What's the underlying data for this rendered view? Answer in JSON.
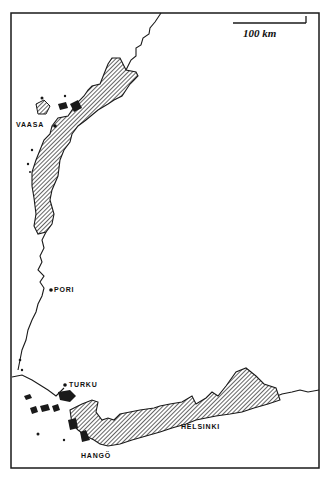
{
  "map": {
    "scale_label": "100 km",
    "colors": {
      "ink": "#1a1a1a",
      "background": "#ffffff",
      "hatch": "#2a2a2a"
    },
    "legend_pattern": "diagonal-hatch",
    "places": [
      {
        "name": "VAASA",
        "x": 16,
        "y": 124
      },
      {
        "name": "PORI",
        "x": 54,
        "y": 289
      },
      {
        "name": "TURKU",
        "x": 69,
        "y": 384
      },
      {
        "name": "HELSINKI",
        "x": 181,
        "y": 426
      },
      {
        "name": "HANGÖ",
        "x": 81,
        "y": 455
      }
    ]
  }
}
